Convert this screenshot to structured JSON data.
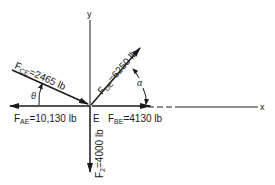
{
  "diagram": {
    "axes": {
      "x_label": "x",
      "y_label": "y"
    },
    "point_label": "E",
    "forces": [
      {
        "id": "FCE",
        "symbol": "F",
        "subscript": "CE",
        "value_text": "=2465 lb",
        "direction": "toward E, from upper-left",
        "angle_symbol": "θ"
      },
      {
        "id": "FDE",
        "symbol": "F",
        "subscript": "DE",
        "value_text": "=6250 lb",
        "direction": "away from E, toward upper-right",
        "angle_symbol": "α"
      },
      {
        "id": "FAE",
        "symbol": "F",
        "subscript": "AE",
        "value_text": "=10,130 lb",
        "direction": "away from E, toward -x"
      },
      {
        "id": "FBE",
        "symbol": "F",
        "subscript": "BE",
        "value_text": "=4130 lb",
        "direction": "toward E, from +x"
      },
      {
        "id": "FZ",
        "symbol": "F",
        "subscript": "2",
        "value_text": "=4000 lb",
        "direction": "away from E, toward -y"
      }
    ],
    "angles": {
      "theta": "θ",
      "alpha": "α"
    },
    "line_color": "#1a1a1a"
  }
}
